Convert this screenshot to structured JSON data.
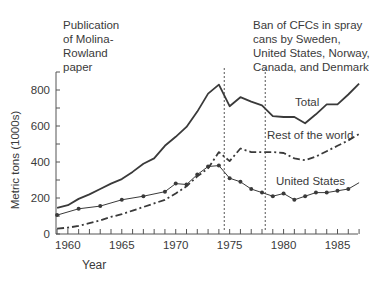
{
  "chart_data": {
    "type": "line",
    "title": "",
    "xlabel": "Year",
    "ylabel": "Metric tons (1000s)",
    "xlim": [
      1959,
      1987
    ],
    "ylim": [
      0,
      900
    ],
    "x_ticks": [
      1960,
      1965,
      1970,
      1975,
      1980,
      1985
    ],
    "y_ticks": [
      0,
      200,
      400,
      600,
      800
    ],
    "grid": false,
    "legend": "inline labels",
    "series": [
      {
        "name": "Total",
        "style": "solid-thick",
        "x": [
          1959,
          1960,
          1961,
          1962,
          1963,
          1964,
          1965,
          1966,
          1967,
          1968,
          1969,
          1970,
          1971,
          1972,
          1973,
          1974,
          1975,
          1976,
          1977,
          1978,
          1979,
          1980,
          1981,
          1982,
          1983,
          1984,
          1985,
          1986,
          1987
        ],
        "values": [
          145,
          160,
          195,
          220,
          250,
          280,
          305,
          345,
          390,
          420,
          490,
          540,
          595,
          680,
          780,
          830,
          710,
          760,
          735,
          715,
          655,
          650,
          650,
          615,
          665,
          720,
          720,
          775,
          835
        ]
      },
      {
        "name": "Rest of the world",
        "style": "dash-dot",
        "x": [
          1959,
          1960,
          1961,
          1962,
          1963,
          1964,
          1965,
          1966,
          1967,
          1968,
          1969,
          1970,
          1971,
          1972,
          1973,
          1974,
          1975,
          1976,
          1977,
          1978,
          1979,
          1980,
          1981,
          1982,
          1983,
          1984,
          1985,
          1986,
          1987
        ],
        "values": [
          30,
          35,
          45,
          60,
          75,
          95,
          110,
          130,
          150,
          170,
          190,
          225,
          265,
          320,
          365,
          455,
          405,
          475,
          455,
          455,
          455,
          450,
          420,
          410,
          430,
          460,
          490,
          520,
          555
        ]
      },
      {
        "name": "United States",
        "style": "solid-thin-markers",
        "x": [
          1959,
          1961,
          1963,
          1965,
          1967,
          1969,
          1970,
          1971,
          1972,
          1973,
          1974,
          1975,
          1976,
          1977,
          1978,
          1979,
          1980,
          1981,
          1982,
          1983,
          1984,
          1985,
          1986,
          1987
        ],
        "values": [
          105,
          140,
          155,
          190,
          210,
          235,
          280,
          275,
          330,
          375,
          380,
          310,
          290,
          250,
          230,
          210,
          225,
          190,
          210,
          230,
          230,
          240,
          250,
          285
        ]
      }
    ],
    "annotations": [
      {
        "x": 1974.5,
        "style": "dotted-vertical",
        "text": "Publication\nof Molina-\nRowland\npaper"
      },
      {
        "x": 1978.3,
        "style": "dotted-vertical",
        "text": "Ban of CFCs in spray\ncans by Sweden,\nUnited States, Norway,\nCanada, and Denmark"
      }
    ]
  },
  "labels": {
    "ylabel": "Metric tons (1000s)",
    "xlabel": "Year",
    "series_total": "Total",
    "series_rest": "Rest of the world",
    "series_us": "United States",
    "annotation_1": "Publication\nof Molina-\nRowland\npaper",
    "annotation_2": "Ban of CFCs in spray\ncans by Sweden,\nUnited States, Norway,\nCanada, and Denmark"
  },
  "colors": {
    "line": "#3a3a3a",
    "axis": "#555555",
    "text": "#3a3a3a"
  }
}
